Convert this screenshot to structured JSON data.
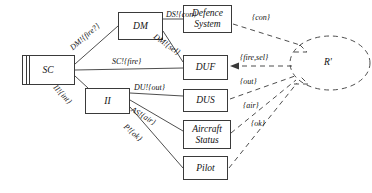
{
  "diagram": {
    "nodes": [
      {
        "id": "sc",
        "label": "SC",
        "kind": "process-box-double-bar"
      },
      {
        "id": "dm",
        "label": "DM",
        "kind": "process-box"
      },
      {
        "id": "ii",
        "label": "II",
        "kind": "process-box"
      },
      {
        "id": "defence_system",
        "label_line1": "Defence",
        "label_line2": "System",
        "kind": "env-box"
      },
      {
        "id": "duf",
        "label": "DUF",
        "kind": "env-box"
      },
      {
        "id": "dus",
        "label": "DUS",
        "kind": "env-box"
      },
      {
        "id": "aircraft_status",
        "label_line1": "Aircraft",
        "label_line2": "Status",
        "kind": "env-box"
      },
      {
        "id": "pilot",
        "label": "Pilot",
        "kind": "env-box"
      },
      {
        "id": "rprime",
        "label": "R'",
        "kind": "dashed-ellipse"
      }
    ],
    "solid_edge_labels": {
      "sc_to_dm": "DM!{fire?}",
      "dm_to_defence": "DS!{con}",
      "dm_to_duf": "DM!{sel}",
      "sc_to_duf": "SC!{fire}",
      "sc_to_ii": "II!{int}",
      "ii_to_dus": "DU!{out}",
      "ii_to_aircraft": "AS!{air}",
      "ii_to_pilot": "P!{ok}"
    },
    "dashed_edge_labels": {
      "defence_to_rprime": "{con}",
      "duf_to_rprime": "{fire,sel}",
      "dus_to_rprime": "{out}",
      "aircraft_to_rprime": "{air}",
      "pilot_to_rprime": "{ok}"
    },
    "colors": {
      "stroke": "#3a3a3a",
      "text": "#111111",
      "background": "#ffffff"
    }
  }
}
